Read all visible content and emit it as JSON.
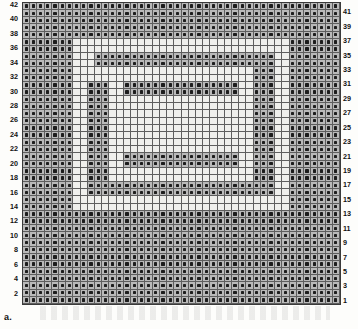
{
  "caption": "a.",
  "chart_data": {
    "type": "heatmap",
    "columns": 44,
    "rows": 42,
    "legend": {
      "filled_symbol": "block-square",
      "filled_meaning": "filled block (solid mesh)",
      "open_meaning": "open mesh (space)"
    },
    "axis": {
      "left_labels_parity": "even",
      "right_labels_parity": "odd",
      "row_numbering_direction": "bottom-to-top",
      "left_tick_labels": [
        42,
        40,
        38,
        36,
        34,
        32,
        30,
        28,
        26,
        24,
        22,
        20,
        18,
        16,
        14,
        12,
        10,
        8,
        6,
        4,
        2
      ],
      "right_tick_labels": [
        41,
        39,
        37,
        35,
        33,
        31,
        29,
        27,
        25,
        23,
        21,
        19,
        17,
        15,
        13,
        11,
        9,
        7,
        5,
        3,
        1
      ]
    },
    "colors": {
      "grid_background": "#b9b9b9",
      "open_cell": "#efefec",
      "grid_line": "#5e5e5e",
      "border": "#3a3a3a",
      "symbol": "#1d1d1d",
      "page": "#fdfdfb",
      "label_text": "#111111"
    },
    "open_cells_by_row_top_to_bottom": [
      [],
      [],
      [],
      [],
      [],
      [
        7,
        8,
        9,
        10,
        11,
        12,
        13,
        14,
        15,
        16,
        17,
        18,
        19,
        20,
        21,
        22,
        23,
        24,
        25,
        26,
        27,
        28,
        29,
        30,
        31,
        32,
        33,
        34,
        35,
        36
      ],
      [
        7,
        8,
        9,
        10,
        11,
        12,
        13,
        14,
        15,
        16,
        17,
        18,
        19,
        20,
        21,
        22,
        23,
        24,
        25,
        26,
        27,
        28,
        29,
        30,
        31,
        32,
        33,
        34,
        35,
        36
      ],
      [
        7,
        8,
        9,
        35,
        36
      ],
      [
        7,
        8,
        9,
        35,
        36
      ],
      [
        7,
        8,
        9,
        10,
        11,
        12,
        13,
        14,
        15,
        16,
        17,
        18,
        19,
        20,
        21,
        22,
        23,
        24,
        25,
        26,
        27,
        28,
        29,
        30,
        31,
        35,
        36
      ],
      [
        7,
        8,
        9,
        10,
        11,
        12,
        13,
        14,
        15,
        16,
        17,
        18,
        19,
        20,
        21,
        22,
        23,
        24,
        25,
        26,
        27,
        28,
        29,
        30,
        31,
        35,
        36
      ],
      [
        7,
        8,
        12,
        13,
        30,
        31,
        35,
        36
      ],
      [
        7,
        8,
        12,
        13,
        30,
        31,
        35,
        36
      ],
      [
        7,
        8,
        12,
        13,
        14,
        15,
        16,
        17,
        18,
        19,
        20,
        21,
        22,
        23,
        24,
        25,
        26,
        27,
        28,
        29,
        30,
        31,
        35,
        36
      ],
      [
        7,
        8,
        12,
        13,
        14,
        15,
        16,
        17,
        18,
        19,
        20,
        21,
        22,
        23,
        24,
        25,
        26,
        27,
        28,
        29,
        30,
        31,
        35,
        36
      ],
      [
        7,
        8,
        12,
        13,
        14,
        15,
        16,
        17,
        18,
        19,
        20,
        21,
        22,
        23,
        24,
        25,
        26,
        27,
        28,
        29,
        30,
        31,
        35,
        36
      ],
      [
        7,
        8,
        12,
        13,
        14,
        15,
        16,
        17,
        18,
        19,
        20,
        21,
        22,
        23,
        24,
        25,
        26,
        27,
        28,
        29,
        30,
        31,
        35,
        36
      ],
      [
        7,
        8,
        12,
        13,
        14,
        15,
        16,
        17,
        18,
        19,
        20,
        21,
        22,
        23,
        24,
        25,
        26,
        27,
        28,
        29,
        30,
        31,
        35,
        36
      ],
      [
        7,
        8,
        12,
        13,
        14,
        15,
        16,
        17,
        18,
        19,
        20,
        21,
        22,
        23,
        24,
        25,
        26,
        27,
        28,
        29,
        30,
        31,
        35,
        36
      ],
      [
        7,
        8,
        12,
        13,
        14,
        15,
        16,
        17,
        18,
        19,
        20,
        21,
        22,
        23,
        24,
        25,
        26,
        27,
        28,
        29,
        30,
        31,
        35,
        36
      ],
      [
        7,
        8,
        12,
        13,
        14,
        15,
        16,
        17,
        18,
        19,
        20,
        21,
        22,
        23,
        24,
        25,
        26,
        27,
        28,
        29,
        30,
        31,
        35,
        36
      ],
      [
        7,
        8,
        12,
        13,
        30,
        31,
        35,
        36
      ],
      [
        7,
        8,
        12,
        13,
        30,
        31,
        35,
        36
      ],
      [
        7,
        8,
        12,
        13,
        14,
        15,
        16,
        17,
        18,
        19,
        20,
        21,
        22,
        23,
        24,
        25,
        26,
        27,
        28,
        29,
        30,
        31,
        35,
        36
      ],
      [
        7,
        8,
        12,
        13,
        14,
        15,
        16,
        17,
        18,
        19,
        20,
        21,
        22,
        23,
        24,
        25,
        26,
        27,
        28,
        29,
        30,
        31,
        35,
        36
      ],
      [
        7,
        8,
        35,
        36
      ],
      [
        7,
        8,
        35,
        36
      ],
      [
        7,
        8,
        9,
        10,
        11,
        12,
        13,
        14,
        15,
        16,
        17,
        18,
        19,
        20,
        21,
        22,
        23,
        24,
        25,
        26,
        27,
        28,
        29,
        30,
        31,
        32,
        33,
        34,
        35,
        36
      ],
      [
        7,
        8,
        9,
        10,
        11,
        12,
        13,
        14,
        15,
        16,
        17,
        18,
        19,
        20,
        21,
        22,
        23,
        24,
        25,
        26,
        27,
        28,
        29,
        30,
        31,
        32,
        33,
        34,
        35,
        36
      ],
      [],
      [],
      [],
      [],
      [],
      [],
      [],
      [],
      [],
      [],
      [],
      [],
      []
    ]
  }
}
